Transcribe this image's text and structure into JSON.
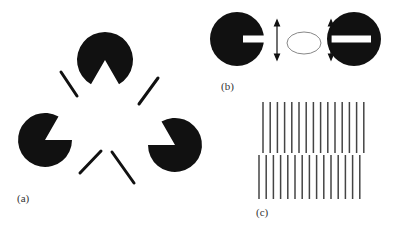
{
  "figure": {
    "panels": [
      {
        "id": "a",
        "label": "(a)",
        "description": "Kanizsa triangle: three pac-man inducers with line segments producing an illusory white triangle",
        "inducers": [
          {
            "cx": 105,
            "cy": 60,
            "r": 28,
            "notch_deg": [
              240,
              300
            ]
          },
          {
            "cx": 45,
            "cy": 140,
            "r": 27,
            "notch_deg": [
              0,
              60
            ]
          },
          {
            "cx": 175,
            "cy": 145,
            "r": 27,
            "notch_deg": [
              120,
              180
            ]
          }
        ],
        "segments": [
          [
            61,
            72,
            77,
            96
          ],
          [
            158,
            78,
            139,
            104
          ],
          [
            80,
            173,
            101,
            151
          ],
          [
            112,
            152,
            134,
            183
          ]
        ]
      },
      {
        "id": "b",
        "label": "(b)",
        "description": "Two black disks with horizontal white slots facing each other, vertical double-headed arrows, and an illusory contour ellipse between them"
      },
      {
        "id": "c",
        "label": "(c)",
        "description": "Two vertical line gratings offset by half a period producing an illusory horizontal contour",
        "top_lines": 15,
        "bottom_lines": 15
      }
    ],
    "colors": {
      "ink": "#111111",
      "grating": "#444444",
      "ghost": "#888888",
      "background": "#ffffff"
    }
  }
}
